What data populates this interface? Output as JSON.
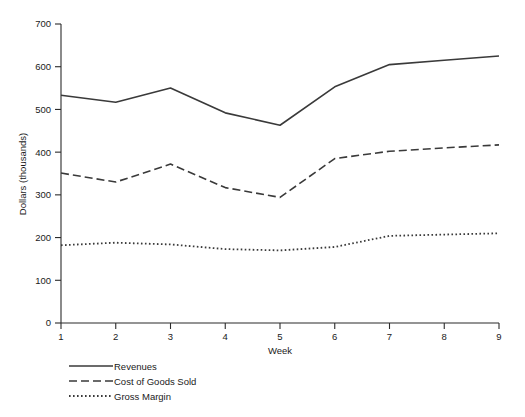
{
  "chart_data": {
    "type": "line",
    "title": "",
    "subtitle": "",
    "xlabel": "Week",
    "ylabel": "Dollars (thousands)",
    "x": [
      1,
      2,
      3,
      4,
      5,
      6,
      7,
      8,
      9
    ],
    "categories": [
      "1",
      "2",
      "3",
      "4",
      "5",
      "6",
      "7",
      "8",
      "9"
    ],
    "xlim": [
      1,
      9
    ],
    "ylim": [
      0,
      700
    ],
    "xticks": [
      "1",
      "2",
      "3",
      "4",
      "5",
      "6",
      "7",
      "8",
      "9"
    ],
    "yticks": [
      "0",
      "100",
      "200",
      "300",
      "400",
      "500",
      "600",
      "700"
    ],
    "grid": false,
    "legend_position": "below-axis-left",
    "series": [
      {
        "name": "Revenues",
        "style": "solid",
        "color": "#3a3a3a",
        "values": [
          533,
          517,
          550,
          492,
          463,
          553,
          605,
          615,
          625
        ]
      },
      {
        "name": "Cost of Goods Sold",
        "style": "dashed",
        "color": "#3a3a3a",
        "values": [
          351,
          330,
          372,
          317,
          294,
          385,
          402,
          410,
          417
        ]
      },
      {
        "name": "Gross Margin",
        "style": "dotted",
        "color": "#3a3a3a",
        "values": [
          182,
          188,
          184,
          173,
          170,
          178,
          204,
          207,
          210
        ]
      }
    ]
  },
  "axes": {
    "y_title": "Dollars (thousands)",
    "x_title": "Week",
    "y_tick_labels": [
      "700",
      "600",
      "500",
      "400",
      "300",
      "200",
      "100",
      "0"
    ],
    "x_tick_labels": [
      "1",
      "2",
      "3",
      "4",
      "5",
      "6",
      "7",
      "8",
      "9"
    ]
  },
  "legend": {
    "entries": [
      {
        "label": "Revenues",
        "style": "solid"
      },
      {
        "label": "Cost of Goods Sold",
        "style": "dashed"
      },
      {
        "label": "Gross Margin",
        "style": "dotted"
      }
    ]
  },
  "colors": {
    "ink": "#2b2b2b",
    "series": "#3a3a3a",
    "background": "#ffffff"
  }
}
